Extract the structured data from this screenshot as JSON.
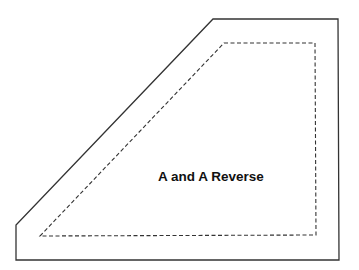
{
  "diagram": {
    "title": "A and A Reverse",
    "colors": {
      "background": "#ffffff",
      "outline": "#333333",
      "seam_line": "#333333",
      "text": "#111111"
    },
    "outer_shape": {
      "type": "solid-outline",
      "points": [
        [
          213,
          19
        ],
        [
          338,
          19
        ],
        [
          339,
          260
        ],
        [
          16,
          260
        ],
        [
          16,
          225
        ]
      ]
    },
    "inner_shape": {
      "type": "dashed-seam-line",
      "points": [
        [
          224,
          43
        ],
        [
          315,
          43
        ],
        [
          316,
          235
        ],
        [
          40,
          236
        ]
      ]
    }
  }
}
